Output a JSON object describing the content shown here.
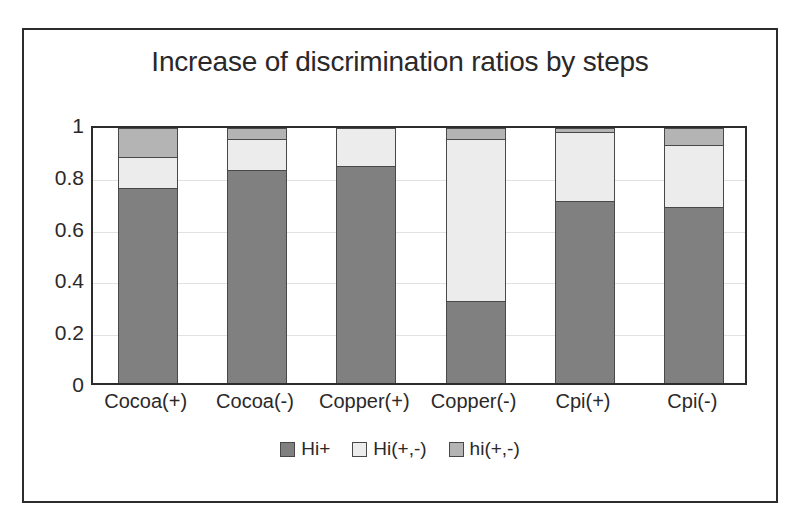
{
  "chart_data": {
    "type": "bar",
    "subtype": "stacked-100-percent",
    "title": "Increase of discrimination ratios by steps",
    "xlabel": "",
    "ylabel": "",
    "ylim": [
      0,
      1
    ],
    "yticks": [
      "0",
      "0.2",
      "0.4",
      "0.6",
      "0.8",
      "1"
    ],
    "ytick_values": [
      0,
      0.2,
      0.4,
      0.6,
      0.8,
      1
    ],
    "grid": true,
    "legend_position": "bottom",
    "categories": [
      "Cocoa(+)",
      "Cocoa(-)",
      "Copper(+)",
      "Copper(-)",
      "Cpi(+)",
      "Cpi(-)"
    ],
    "series": [
      {
        "name": "Hi+",
        "color": "#808080",
        "values": [
          0.765,
          0.835,
          0.85,
          0.32,
          0.715,
          0.69
        ]
      },
      {
        "name": "Hi(+,-)",
        "color": "#ececec",
        "values": [
          0.12,
          0.12,
          0.15,
          0.635,
          0.27,
          0.245
        ]
      },
      {
        "name": "hi(+,-)",
        "color": "#b4b4b4",
        "values": [
          0.115,
          0.045,
          0.0,
          0.045,
          0.015,
          0.065
        ]
      }
    ],
    "cumulative_tops": [
      [
        0.765,
        0.885,
        1.0
      ],
      [
        0.835,
        0.955,
        1.0
      ],
      [
        0.85,
        1.0,
        1.0
      ],
      [
        0.32,
        0.955,
        1.0
      ],
      [
        0.715,
        0.985,
        1.0
      ],
      [
        0.69,
        0.935,
        1.0
      ]
    ]
  },
  "legend": {
    "items": [
      {
        "label": "Hi+",
        "color": "#808080"
      },
      {
        "label": "Hi(+,-)",
        "color": "#ececec"
      },
      {
        "label": "hi(+,-)",
        "color": "#b4b4b4"
      }
    ]
  },
  "colors": {
    "axis": "#2e2b2c",
    "gridline": "#e3e1e2",
    "text": "#2b2829",
    "background": "#ffffff",
    "frame_border": "#2e2b2c"
  }
}
